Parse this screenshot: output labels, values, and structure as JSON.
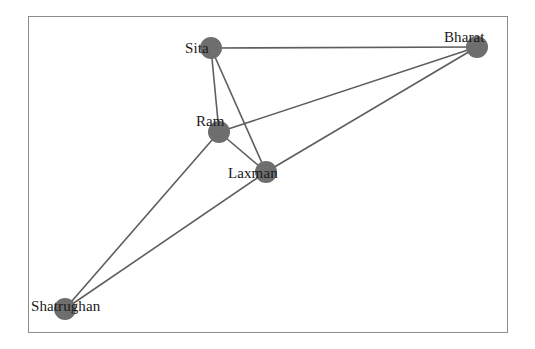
{
  "diagram": {
    "frame": {
      "x": 28,
      "y": 16,
      "width": 480,
      "height": 317,
      "border_color": "#8d8d8d"
    },
    "node_color": "#6e6e6e",
    "edge_color": "#5e5e5e",
    "label_color": "#1a1a1a",
    "nodes": [
      {
        "id": "sita",
        "label": "Sita",
        "x": 211,
        "y": 48,
        "r": 11,
        "label_x": 185,
        "label_y": 41
      },
      {
        "id": "bharat",
        "label": "Bharat",
        "x": 477,
        "y": 47,
        "r": 11,
        "label_x": 444,
        "label_y": 30
      },
      {
        "id": "ram",
        "label": "Ram",
        "x": 219,
        "y": 132,
        "r": 11,
        "label_x": 196,
        "label_y": 114
      },
      {
        "id": "laxman",
        "label": "Laxman",
        "x": 266,
        "y": 172,
        "r": 11,
        "label_x": 228,
        "label_y": 166
      },
      {
        "id": "shatrughan",
        "label": "Shatrughan",
        "x": 65,
        "y": 309,
        "r": 11,
        "label_x": 31,
        "label_y": 299
      }
    ],
    "edges": [
      {
        "id": "sita-bharat",
        "source": "sita",
        "target": "bharat"
      },
      {
        "id": "sita-ram",
        "source": "sita",
        "target": "ram"
      },
      {
        "id": "sita-laxman",
        "source": "sita",
        "target": "laxman"
      },
      {
        "id": "ram-bharat",
        "source": "ram",
        "target": "bharat"
      },
      {
        "id": "ram-laxman",
        "source": "ram",
        "target": "laxman"
      },
      {
        "id": "ram-shatrughan",
        "source": "ram",
        "target": "shatrughan"
      },
      {
        "id": "laxman-bharat",
        "source": "laxman",
        "target": "bharat"
      },
      {
        "id": "laxman-shatrughan",
        "source": "laxman",
        "target": "shatrughan"
      }
    ]
  }
}
